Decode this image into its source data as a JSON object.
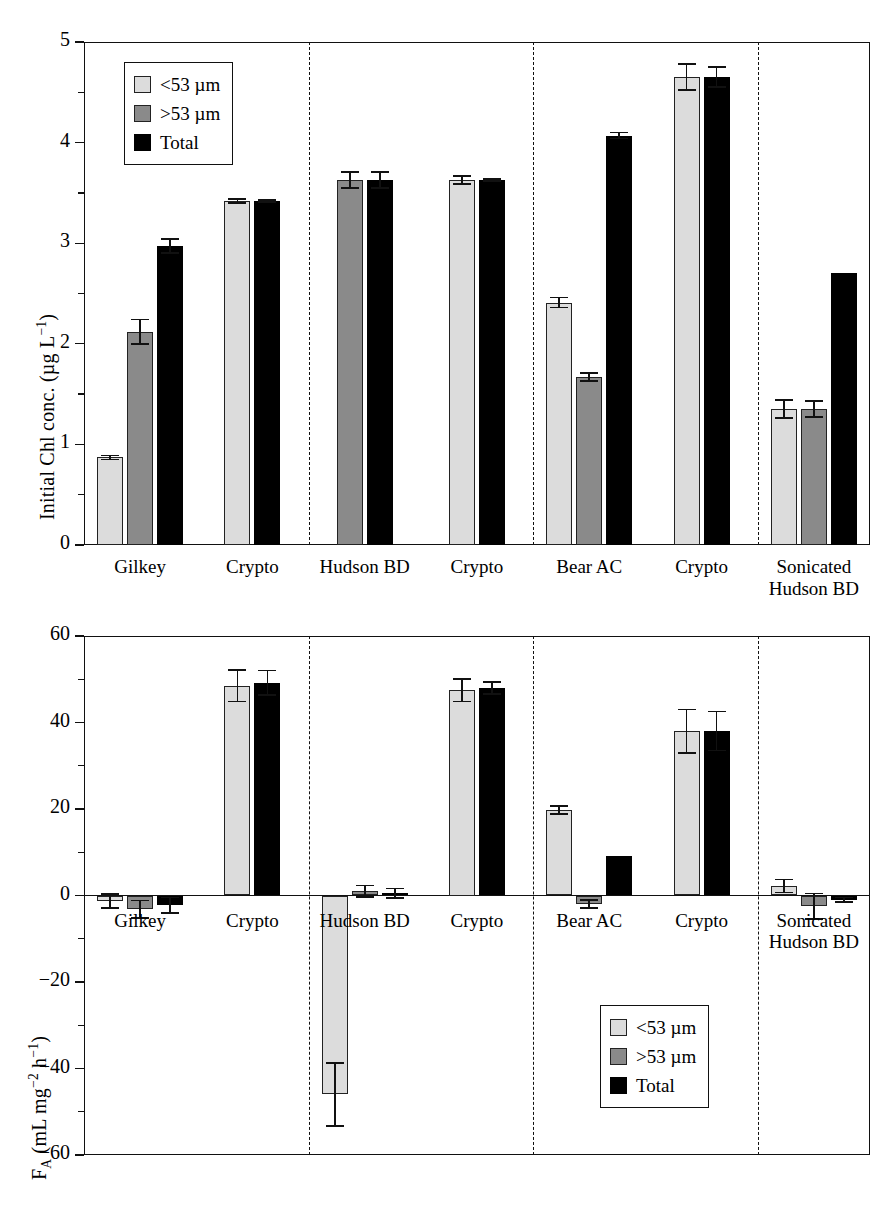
{
  "legend": {
    "items": [
      {
        "label": "<53 µm",
        "key": "light",
        "color": "#dcdcdc"
      },
      {
        "label": ">53 µm",
        "key": "dark",
        "color": "#8a8a8a"
      },
      {
        "label": "Total",
        "key": "total",
        "color": "#000000"
      }
    ]
  },
  "chart_data": [
    {
      "type": "bar",
      "panel": "top",
      "title": "",
      "xlabel": "",
      "ylabel": "Initial Chl conc. (µg L⁻¹)",
      "ylim": [
        0,
        5
      ],
      "yticks": [
        0,
        1,
        2,
        3,
        4,
        5
      ],
      "ytick_labels": [
        "0",
        "1",
        "2",
        "3",
        "4",
        "5"
      ],
      "yminor_step": 0.5,
      "grid": false,
      "legend_position": "top-left",
      "categories": [
        "Gilkey",
        "Crypto",
        "Hudson BD",
        "Crypto",
        "Bear AC",
        "Crypto",
        "Sonicated Hudson BD"
      ],
      "group_dividers_after": [
        "Crypto",
        "Crypto",
        "Crypto"
      ],
      "series": [
        {
          "name": "<53 µm",
          "key": "light",
          "values": [
            0.87,
            3.42,
            null,
            3.63,
            2.41,
            4.65,
            1.35
          ],
          "errors": [
            0.02,
            0.02,
            null,
            0.04,
            0.05,
            0.13,
            0.09
          ]
        },
        {
          "name": ">53 µm",
          "key": "dark",
          "values": [
            2.12,
            null,
            3.63,
            null,
            1.67,
            null,
            1.35
          ],
          "errors": [
            0.12,
            null,
            0.08,
            null,
            0.04,
            null,
            0.08
          ]
        },
        {
          "name": "Total",
          "key": "total",
          "values": [
            2.97,
            3.42,
            3.63,
            3.63,
            4.07,
            4.65,
            2.7
          ],
          "errors": [
            0.07,
            0.01,
            0.08,
            0.01,
            0.03,
            0.1,
            0.0
          ]
        }
      ]
    },
    {
      "type": "bar",
      "panel": "bottom",
      "title": "",
      "xlabel": "",
      "ylabel": "Fᴀ (mL mg⁻² h⁻¹)",
      "ylim": [
        -60,
        60
      ],
      "yticks": [
        -60,
        -40,
        -20,
        0,
        20,
        40,
        60
      ],
      "ytick_labels": [
        "−60",
        "−40",
        "−20",
        "0",
        "20",
        "40",
        "60"
      ],
      "yminor_step": 10,
      "grid": false,
      "legend_position": "bottom-right",
      "categories": [
        "Gilkey",
        "Crypto",
        "Hudson BD",
        "Crypto",
        "Bear AC",
        "Crypto",
        "Sonicated Hudson BD"
      ],
      "group_dividers_after": [
        "Crypto",
        "Crypto",
        "Crypto"
      ],
      "series": [
        {
          "name": "<53 µm",
          "key": "light",
          "values": [
            -1.3,
            48.5,
            -46.0,
            47.5,
            19.8,
            38.0,
            2.2
          ],
          "errors": [
            1.6,
            3.6,
            7.3,
            2.6,
            0.9,
            5.0,
            1.5
          ]
        },
        {
          "name": ">53 µm",
          "key": "dark",
          "values": [
            -3.2,
            null,
            1.0,
            null,
            -2.0,
            null,
            -2.5
          ],
          "errors": [
            2.0,
            null,
            1.3,
            null,
            0.9,
            null,
            3.0
          ]
        },
        {
          "name": "Total",
          "key": "total",
          "values": [
            -2.3,
            49.2,
            0.5,
            48.0,
            9.2,
            38.0,
            -1.0
          ],
          "errors": [
            1.8,
            2.8,
            1.1,
            1.4,
            0.0,
            4.5,
            0.5
          ]
        }
      ]
    }
  ]
}
